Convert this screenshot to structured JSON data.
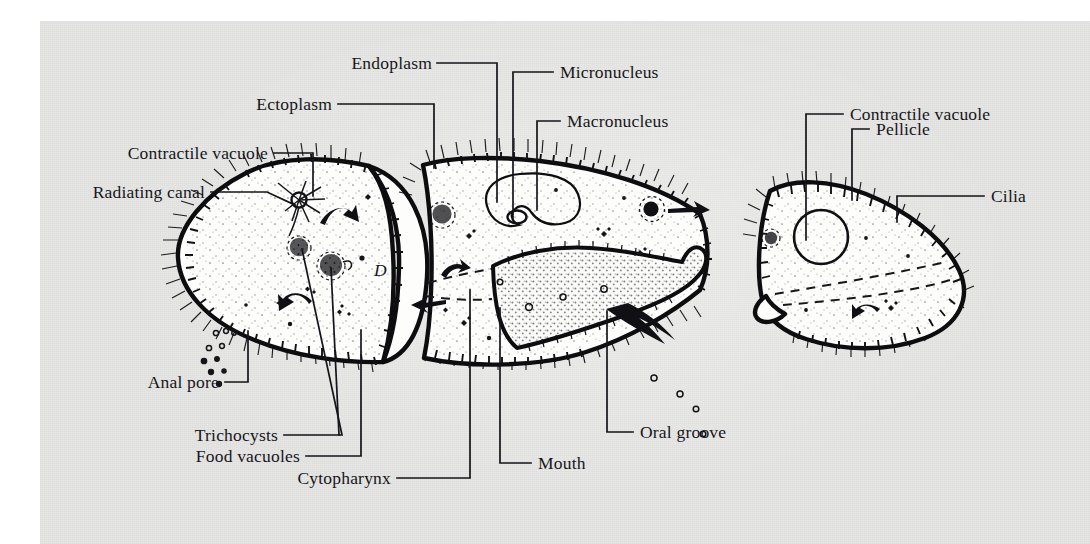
{
  "figure": {
    "background_color": "#e6e6e4",
    "ink_color": "#101014",
    "cell_fill_color": "#fcfcfb"
  },
  "labels": [
    {
      "id": "endoplasm",
      "text": "Endoplasm",
      "align": "end"
    },
    {
      "id": "micronucleus",
      "text": "Micronucleus",
      "align": "start"
    },
    {
      "id": "ectoplasm",
      "text": "Ectoplasm",
      "align": "end"
    },
    {
      "id": "macronucleus",
      "text": "Macronucleus",
      "align": "start"
    },
    {
      "id": "contractile-vacuole-right",
      "text": "Contractile vacuole",
      "align": "start"
    },
    {
      "id": "contractile-vacuole-left",
      "text": "Contractile vacuole",
      "align": "end"
    },
    {
      "id": "pellicle",
      "text": "Pellicle",
      "align": "start"
    },
    {
      "id": "radiating-canal",
      "text": "Radiating canal",
      "align": "end"
    },
    {
      "id": "cilia",
      "text": "Cilia",
      "align": "start"
    },
    {
      "id": "anal-pore",
      "text": "Anal pore",
      "align": "end"
    },
    {
      "id": "trichocysts",
      "text": "Trichocysts",
      "align": "end"
    },
    {
      "id": "food-vacuoles",
      "text": "Food vacuoles",
      "align": "end"
    },
    {
      "id": "cytopharynx",
      "text": "Cytopharynx",
      "align": "end"
    },
    {
      "id": "mouth",
      "text": "Mouth",
      "align": "start"
    },
    {
      "id": "oral-groove",
      "text": "Oral groove",
      "align": "start"
    }
  ],
  "annotations": {
    "anterior_marking": "D"
  }
}
